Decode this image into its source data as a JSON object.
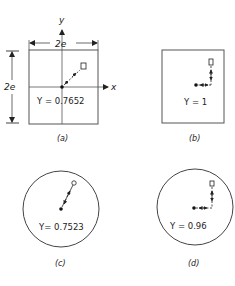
{
  "panels": {
    "a": {
      "caption": "(a)",
      "gamma_label": "Y = 0.7652",
      "shape": "square",
      "axis_x": "x",
      "axis_y": "y",
      "width_label": "2e",
      "height_label": "2e"
    },
    "b": {
      "caption": "(b)",
      "gamma_label": "Y = 1",
      "shape": "square"
    },
    "c": {
      "caption": "(c)",
      "gamma_label": "Y= 0.7523",
      "shape": "circle"
    },
    "d": {
      "caption": "(d)",
      "gamma_label": "Y = 0.96",
      "shape": "circle"
    }
  },
  "colors": {
    "line": "#333333",
    "ink": "#222222"
  }
}
